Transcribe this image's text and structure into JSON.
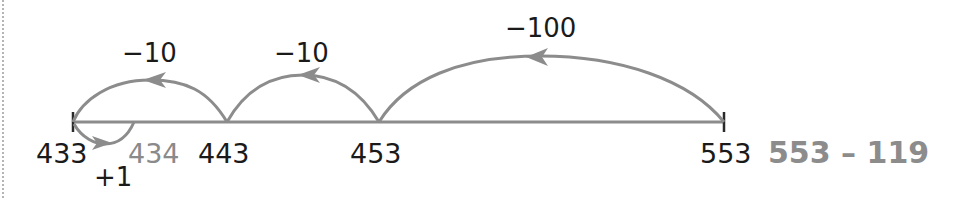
{
  "diagram": {
    "type": "number-line-subtraction",
    "expression": "553 – 119",
    "colors": {
      "line": "#8c8c8c",
      "arc": "#8c8c8c",
      "text": "#1a1a1a",
      "secondary_text": "#8a8a8a"
    },
    "points": [
      {
        "value": "433",
        "highlight": false
      },
      {
        "value": "434",
        "highlight": true
      },
      {
        "value": "443",
        "highlight": false
      },
      {
        "value": "453",
        "highlight": false
      },
      {
        "value": "553",
        "highlight": false
      }
    ],
    "jumps": [
      {
        "label": "−100",
        "from": "553",
        "to": "453",
        "direction": "left",
        "position": "above"
      },
      {
        "label": "−10",
        "from": "453",
        "to": "443",
        "direction": "left",
        "position": "above"
      },
      {
        "label": "−10",
        "from": "443",
        "to": "433",
        "direction": "left",
        "position": "above"
      },
      {
        "label": "+1",
        "from": "433",
        "to": "434",
        "direction": "right",
        "position": "below"
      }
    ]
  }
}
